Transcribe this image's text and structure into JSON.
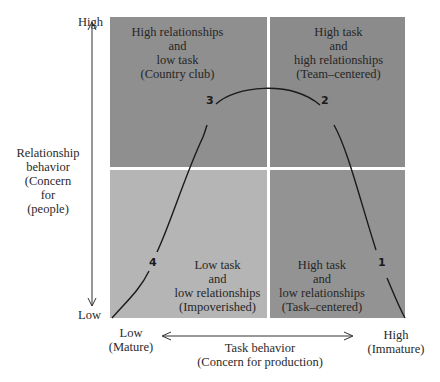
{
  "diagram": {
    "colors": {
      "quadrant_top_left": "#8f8f8f",
      "quadrant_top_right": "#8b8b8b",
      "quadrant_bottom_left": "#b5b5b5",
      "quadrant_bottom_right": "#939393",
      "divider": "#ffffff",
      "curve": "#1a1a1a"
    },
    "quadrants": {
      "top_left": {
        "lines": [
          "High relationships",
          "and",
          "low task",
          "(Country club)"
        ]
      },
      "top_right": {
        "lines": [
          "High task",
          "and",
          "high relationships",
          "(Team–centered)"
        ]
      },
      "bottom_left": {
        "lines": [
          "Low task",
          "and",
          "low relationships",
          "(Impoverished)"
        ]
      },
      "bottom_right": {
        "lines": [
          "High task",
          "and",
          "low relationships",
          "(Task–centered)"
        ]
      }
    },
    "y_axis": {
      "high_label": "High",
      "low_label": "Low",
      "title_lines": [
        "Relationship",
        "behavior",
        "(Concern",
        "for",
        "(people)"
      ]
    },
    "x_axis": {
      "low_lines": [
        "Low",
        "(Mature)"
      ],
      "high_lines": [
        "High",
        "(Immature)"
      ],
      "title_lines": [
        "Task behavior",
        "(Concern for production)"
      ]
    },
    "curve_points": [
      {
        "label": "1",
        "quadrant": "bottom_right"
      },
      {
        "label": "2",
        "quadrant": "top_right"
      },
      {
        "label": "3",
        "quadrant": "top_left"
      },
      {
        "label": "4",
        "quadrant": "bottom_left"
      }
    ]
  }
}
